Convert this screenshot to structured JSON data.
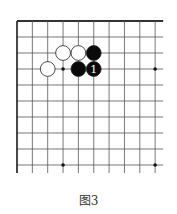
{
  "caption": "图3",
  "board": {
    "origin_x": 17,
    "origin_y": 21,
    "dx": 15.35,
    "dy": 16.0,
    "cols": 10,
    "rows": 10,
    "line_color": "#555555",
    "edge_color": "#333333",
    "star_points": [
      [
        3,
        3
      ],
      [
        9,
        3
      ],
      [
        3,
        9
      ],
      [
        9,
        9
      ]
    ],
    "stones": [
      {
        "col": 3,
        "row": 2,
        "color": "white",
        "label": ""
      },
      {
        "col": 4,
        "row": 2,
        "color": "white",
        "label": ""
      },
      {
        "col": 5,
        "row": 2,
        "color": "black",
        "label": ""
      },
      {
        "col": 2,
        "row": 3,
        "color": "white",
        "label": ""
      },
      {
        "col": 4,
        "row": 3,
        "color": "black",
        "label": ""
      },
      {
        "col": 5,
        "row": 3,
        "color": "black",
        "label": "1"
      }
    ]
  }
}
